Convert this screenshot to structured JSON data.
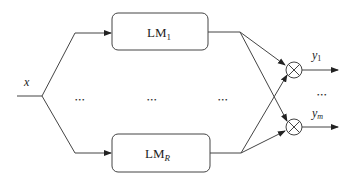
{
  "diagram": {
    "input": {
      "label": "x"
    },
    "modules": [
      {
        "label": "LM",
        "subscript": "1"
      },
      {
        "label": "LM",
        "subscript": "R"
      }
    ],
    "outputs": [
      {
        "label": "y",
        "subscript": "1"
      },
      {
        "label": "y",
        "subscript": "m"
      }
    ],
    "ellipsis": "•••",
    "operator_symbol": "multiply-circle",
    "colors": {
      "line": "#333333",
      "box_stroke": "#444444",
      "text": "#222222"
    }
  }
}
